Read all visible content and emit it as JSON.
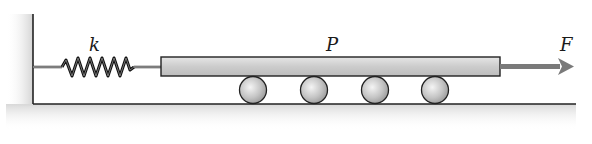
{
  "diagram": {
    "labels": {
      "spring_constant": "k",
      "plate": "P",
      "force": "F"
    },
    "components": {
      "wall": "fixed support (left)",
      "spring": "spring with constant k",
      "plate": "plate P",
      "rollers": 4,
      "force_direction": "right"
    },
    "colors": {
      "plate_fill": "#cfcfcf",
      "roller_fill": "#c8c8c8",
      "arrow": "#7a7a7a",
      "ground_shade": "#e0e0e0",
      "line": "#222222"
    }
  }
}
